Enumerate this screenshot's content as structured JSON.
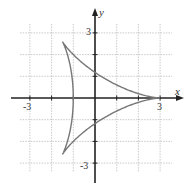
{
  "chart_data": {
    "type": "line",
    "title": "",
    "xlabel": "x",
    "ylabel": "y",
    "xlim": [
      -4,
      4
    ],
    "ylim": [
      -4,
      4
    ],
    "grid": true,
    "legend": null,
    "x_tick_labels": [
      {
        "value": -3,
        "label": "-3"
      },
      {
        "value": 3,
        "label": "3"
      }
    ],
    "y_tick_labels": [
      {
        "value": 3,
        "label": "3"
      },
      {
        "value": -3,
        "label": "-3"
      }
    ],
    "ticks": [
      -3,
      -2,
      -1,
      1,
      2,
      3
    ],
    "series": [
      {
        "name": "deltoid",
        "parametric": "x = 2cos(t) + cos(2t), y = 2sin(t) - sin(2t), 0 <= t <= 2pi",
        "cusps": [
          [
            3,
            0
          ],
          [
            -1.5,
            2.598
          ],
          [
            -1.5,
            -2.598
          ]
        ],
        "y_intercepts": [
          1.299,
          -1.299
        ],
        "x_intercepts": [
          -1,
          3
        ],
        "color": "#777777"
      }
    ]
  },
  "labels": {
    "x_axis": "x",
    "y_axis": "y",
    "x_neg3": "-3",
    "x_pos3": "3",
    "y_pos3": "3",
    "y_neg3": "-3"
  },
  "colors": {
    "axis": "#222222",
    "grid": "#bdbdbd",
    "curve": "#777777"
  }
}
